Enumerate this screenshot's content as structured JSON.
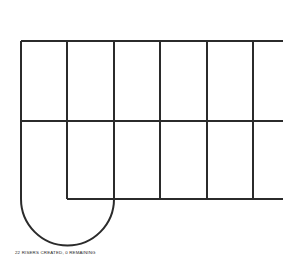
{
  "document": {
    "title": "Riser Layout",
    "background_color": "#ffffff"
  },
  "status": {
    "caption": "22 RISERS CREATED, 0 REMAINING",
    "risers_created": 22,
    "risers_remaining": 0,
    "text_color": "#262626"
  },
  "drawing": {
    "name": "stair-riser-layout",
    "stroke_color": "#2b2b2b",
    "stroke_width": 2,
    "width": 296,
    "height": 276,
    "horizontal_lines": [
      {
        "name": "top-rail",
        "y": 41,
        "x1": 21,
        "x2": 283
      },
      {
        "name": "middle-rail",
        "y": 121,
        "x1": 21,
        "x2": 283
      },
      {
        "name": "bottom-rail",
        "y": 199,
        "x1": 67,
        "x2": 283
      }
    ],
    "vertical_lines": [
      {
        "name": "riser-line-1",
        "x": 21,
        "y1": 41,
        "y2": 199
      },
      {
        "name": "riser-line-2",
        "x": 67,
        "y1": 41,
        "y2": 199
      },
      {
        "name": "riser-line-3",
        "x": 114,
        "y1": 41,
        "y2": 199
      },
      {
        "name": "riser-line-4",
        "x": 160,
        "y1": 41,
        "y2": 199
      },
      {
        "name": "riser-line-5",
        "x": 207,
        "y1": 41,
        "y2": 199
      },
      {
        "name": "riser-line-6",
        "x": 253,
        "y1": 41,
        "y2": 199
      }
    ],
    "winder_arc": {
      "name": "u-turn-winder",
      "center_x": 67.5,
      "center_y": 199,
      "radius": 46.5,
      "start_x": 21,
      "start_y": 199,
      "end_x": 114,
      "end_y": 199
    }
  }
}
